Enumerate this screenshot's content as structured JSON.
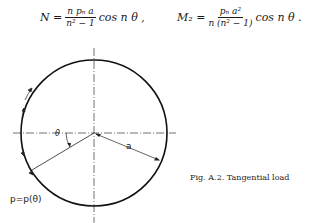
{
  "equations": {
    "eq1": {
      "lhs": "N =",
      "num": "n pₙ a",
      "den": "n² − 1",
      "rhs": "cos n θ ,"
    },
    "eq2": {
      "lhs": "M₂ =",
      "num": "pₙ a²",
      "den": "n (n² − 1)",
      "rhs": "cos n θ ."
    }
  },
  "figure": {
    "angle_label": "θ",
    "radius_label": "a",
    "load_label": "p=p(θ)",
    "caption": "Fig. A.2. Tangential load"
  }
}
